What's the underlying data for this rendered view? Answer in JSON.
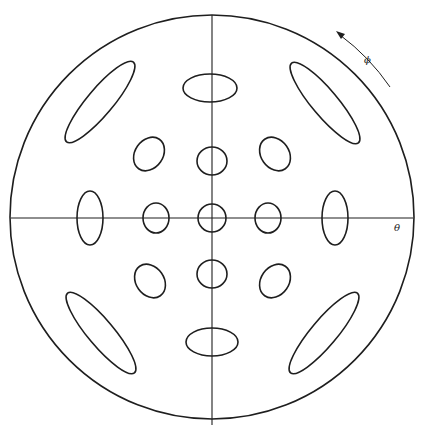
{
  "diagram": {
    "type": "polar diffraction / mode pattern",
    "labels": {
      "theta": "θ",
      "phi": "ϕ"
    },
    "outer_circle": {
      "cx": 212,
      "cy": 217,
      "r": 202
    },
    "axes": {
      "horizontal": {
        "x1": 11,
        "x2": 413,
        "y": 218
      },
      "vertical": {
        "x": 212,
        "y1": 15,
        "y2": 425
      }
    },
    "ellipses": [
      {
        "id": "center",
        "cx": 212,
        "cy": 218,
        "rx": 14,
        "ry": 14,
        "rot": 0
      },
      {
        "id": "inner-left",
        "cx": 156,
        "cy": 218,
        "rx": 13,
        "ry": 15,
        "rot": 0
      },
      {
        "id": "inner-right",
        "cx": 268,
        "cy": 218,
        "rx": 13,
        "ry": 15,
        "rot": 0
      },
      {
        "id": "inner-top",
        "cx": 212,
        "cy": 161,
        "rx": 15,
        "ry": 14,
        "rot": 0
      },
      {
        "id": "inner-bottom",
        "cx": 212,
        "cy": 274,
        "rx": 15,
        "ry": 14,
        "rot": 0
      },
      {
        "id": "diag-ul",
        "cx": 149,
        "cy": 154,
        "rx": 14,
        "ry": 18,
        "rot": 35
      },
      {
        "id": "diag-ur",
        "cx": 275,
        "cy": 154,
        "rx": 14,
        "ry": 18,
        "rot": -35
      },
      {
        "id": "diag-ll",
        "cx": 150,
        "cy": 281,
        "rx": 14,
        "ry": 18,
        "rot": -35
      },
      {
        "id": "diag-lr",
        "cx": 275,
        "cy": 281,
        "rx": 14,
        "ry": 18,
        "rot": 35
      },
      {
        "id": "mid-top",
        "cx": 210,
        "cy": 88,
        "rx": 27,
        "ry": 14,
        "rot": 0
      },
      {
        "id": "mid-bottom",
        "cx": 212,
        "cy": 342,
        "rx": 26,
        "ry": 14,
        "rot": 0
      },
      {
        "id": "mid-left",
        "cx": 90,
        "cy": 218,
        "rx": 13,
        "ry": 27,
        "rot": 0
      },
      {
        "id": "mid-right",
        "cx": 335,
        "cy": 218,
        "rx": 13,
        "ry": 27,
        "rot": 0
      },
      {
        "id": "outer-ul",
        "cx": 100,
        "cy": 102,
        "rx": 52,
        "ry": 13,
        "rot": -50
      },
      {
        "id": "outer-ur",
        "cx": 325,
        "cy": 103,
        "rx": 52,
        "ry": 13,
        "rot": 50
      },
      {
        "id": "outer-ll",
        "cx": 101,
        "cy": 333,
        "rx": 52,
        "ry": 13,
        "rot": 50
      },
      {
        "id": "outer-lr",
        "cx": 324,
        "cy": 333,
        "rx": 52,
        "ry": 13,
        "rot": -50
      }
    ],
    "colors": {
      "line": "#1e1e1e",
      "background": "#ffffff"
    }
  }
}
